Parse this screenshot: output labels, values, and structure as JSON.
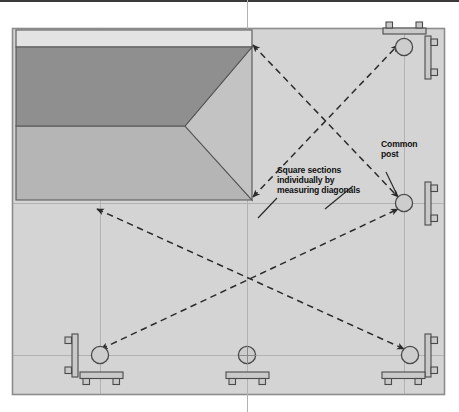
{
  "diagram": {
    "title_rule": "",
    "annotations": {
      "square_sections": "Square sections\nindividually by\nmeasuring diagonals",
      "square_sections_line1": "Square sections",
      "square_sections_line2": "individually by",
      "square_sections_line3": "measuring diagonals",
      "common_post_line1": "Common",
      "common_post_line2": "post",
      "common_post": "Common post"
    },
    "colors": {
      "page_background": "#ffffff",
      "top_rule": "#3a3a3a",
      "panel_fill": "#d4d4d4",
      "panel_border": "#8c8c8c",
      "slab_light": "#e2e2e2",
      "slab_dark": "#8f8f8f",
      "slab_medium": "#b4b4b4",
      "slab_triangle": "#c0c0c0",
      "outline": "#4a4a4a",
      "guide_line": "#b0b0b0",
      "dashed_arrow": "#2b2b2b",
      "leader_line": "#2b2b2b",
      "post_fill": "#c9c9c9",
      "post_stroke": "#4a4a4a"
    },
    "geometry": {
      "panel": {
        "x": 12,
        "y": 28,
        "w": 433,
        "h": 367
      },
      "slab": {
        "x": 16,
        "y": 30,
        "w": 236,
        "h": 170
      },
      "dark_band": {
        "y_top": 47,
        "y_bottom": 126
      },
      "triangle_apex": {
        "x": 185,
        "y": 126
      },
      "guide_horizontal_y": [
        203,
        355
      ],
      "guide_vertical_x": [
        106,
        251,
        404
      ]
    },
    "posts": [
      {
        "name": "post-top-right",
        "cx": 404,
        "cy": 47,
        "r": 9,
        "bracket_top": true,
        "bracket_right": true,
        "bracket_left": false,
        "bracket_bottom": false,
        "arrow_in": true
      },
      {
        "name": "post-middle-right",
        "cx": 404,
        "cy": 203,
        "r": 9,
        "bracket_top": false,
        "bracket_right": true,
        "bracket_left": false,
        "bracket_bottom": false,
        "arrow_in": true
      },
      {
        "name": "post-bottom-left",
        "cx": 100,
        "cy": 355,
        "r": 9,
        "bracket_top": false,
        "bracket_right": false,
        "bracket_left": true,
        "bracket_bottom": true,
        "arrow_in": true
      },
      {
        "name": "post-bottom-middle",
        "cx": 247,
        "cy": 355,
        "r": 9,
        "bracket_top": false,
        "bracket_right": false,
        "bracket_left": false,
        "bracket_bottom": true,
        "arrow_in": false
      },
      {
        "name": "post-bottom-right",
        "cx": 410,
        "cy": 355,
        "r": 9,
        "bracket_top": false,
        "bracket_right": true,
        "bracket_left": false,
        "bracket_bottom": true,
        "arrow_in": true
      }
    ],
    "diagonals": [
      {
        "name": "diagonal-upper-nw-se",
        "x1": 252,
        "y1": 44,
        "x2": 399,
        "y2": 198,
        "double_headed": true
      },
      {
        "name": "diagonal-upper-sw-ne",
        "x1": 252,
        "y1": 198,
        "x2": 399,
        "y2": 44,
        "double_headed": true
      },
      {
        "name": "diagonal-lower-nw-se",
        "x1": 96,
        "y1": 208,
        "x2": 405,
        "y2": 350,
        "double_headed": true
      },
      {
        "name": "diagonal-lower-sw-ne",
        "x1": 100,
        "y1": 350,
        "x2": 399,
        "y2": 208,
        "double_headed": true
      }
    ],
    "leaders": [
      {
        "name": "leader-square-sections-upper",
        "x1": 324,
        "y1": 207,
        "x2": 352,
        "y2": 185
      },
      {
        "name": "leader-square-sections-lower",
        "x1": 258,
        "y1": 215,
        "x2": 275,
        "y2": 196
      },
      {
        "name": "leader-common-post",
        "x1": 398,
        "y1": 198,
        "x2": 385,
        "y2": 170
      }
    ]
  }
}
